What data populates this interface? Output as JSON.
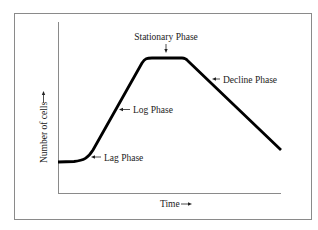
{
  "diagram": {
    "x_axis_label": "Time",
    "x_axis_arrow": "→",
    "y_axis_label": "Number of cells",
    "y_axis_arrow": "→",
    "phases": [
      {
        "name": "Lag Phase"
      },
      {
        "name": "Log Phase"
      },
      {
        "name": "Stationary Phase"
      },
      {
        "name": "Decline Phase"
      }
    ],
    "colors": {
      "curve": "#000000",
      "frame": "#8a8a8a",
      "axis": "#8a8a8a",
      "text": "#222222"
    }
  }
}
